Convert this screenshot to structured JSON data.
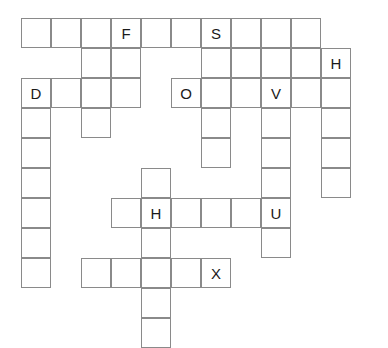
{
  "puzzle": {
    "title": "crossword-grid",
    "grid": {
      "origin_x": 21,
      "origin_y": 18,
      "cell_size": 30,
      "columns": 11,
      "rows": 11,
      "border_color": "#8a8a8a",
      "cell_background": "#ffffff",
      "letter_color": "#1a1a1a",
      "page_background": "#ffffff"
    },
    "cells": [
      {
        "row": 0,
        "col": 0,
        "letter": ""
      },
      {
        "row": 0,
        "col": 1,
        "letter": ""
      },
      {
        "row": 0,
        "col": 2,
        "letter": ""
      },
      {
        "row": 0,
        "col": 3,
        "letter": "F"
      },
      {
        "row": 0,
        "col": 4,
        "letter": ""
      },
      {
        "row": 0,
        "col": 5,
        "letter": ""
      },
      {
        "row": 0,
        "col": 6,
        "letter": "S"
      },
      {
        "row": 0,
        "col": 7,
        "letter": ""
      },
      {
        "row": 0,
        "col": 8,
        "letter": ""
      },
      {
        "row": 0,
        "col": 9,
        "letter": ""
      },
      {
        "row": 1,
        "col": 2,
        "letter": ""
      },
      {
        "row": 1,
        "col": 3,
        "letter": ""
      },
      {
        "row": 1,
        "col": 6,
        "letter": ""
      },
      {
        "row": 1,
        "col": 7,
        "letter": ""
      },
      {
        "row": 1,
        "col": 8,
        "letter": ""
      },
      {
        "row": 1,
        "col": 9,
        "letter": ""
      },
      {
        "row": 1,
        "col": 10,
        "letter": "H"
      },
      {
        "row": 2,
        "col": 0,
        "letter": "D"
      },
      {
        "row": 2,
        "col": 1,
        "letter": ""
      },
      {
        "row": 2,
        "col": 2,
        "letter": ""
      },
      {
        "row": 2,
        "col": 3,
        "letter": ""
      },
      {
        "row": 2,
        "col": 5,
        "letter": "O"
      },
      {
        "row": 2,
        "col": 6,
        "letter": ""
      },
      {
        "row": 2,
        "col": 7,
        "letter": ""
      },
      {
        "row": 2,
        "col": 8,
        "letter": "V"
      },
      {
        "row": 2,
        "col": 9,
        "letter": ""
      },
      {
        "row": 2,
        "col": 10,
        "letter": ""
      },
      {
        "row": 3,
        "col": 0,
        "letter": ""
      },
      {
        "row": 3,
        "col": 2,
        "letter": ""
      },
      {
        "row": 3,
        "col": 6,
        "letter": ""
      },
      {
        "row": 3,
        "col": 8,
        "letter": ""
      },
      {
        "row": 3,
        "col": 10,
        "letter": ""
      },
      {
        "row": 4,
        "col": 0,
        "letter": ""
      },
      {
        "row": 4,
        "col": 6,
        "letter": ""
      },
      {
        "row": 4,
        "col": 8,
        "letter": ""
      },
      {
        "row": 4,
        "col": 10,
        "letter": ""
      },
      {
        "row": 5,
        "col": 0,
        "letter": ""
      },
      {
        "row": 5,
        "col": 4,
        "letter": ""
      },
      {
        "row": 5,
        "col": 8,
        "letter": ""
      },
      {
        "row": 5,
        "col": 10,
        "letter": ""
      },
      {
        "row": 6,
        "col": 0,
        "letter": ""
      },
      {
        "row": 6,
        "col": 3,
        "letter": ""
      },
      {
        "row": 6,
        "col": 4,
        "letter": "H"
      },
      {
        "row": 6,
        "col": 5,
        "letter": ""
      },
      {
        "row": 6,
        "col": 6,
        "letter": ""
      },
      {
        "row": 6,
        "col": 7,
        "letter": ""
      },
      {
        "row": 6,
        "col": 8,
        "letter": "U"
      },
      {
        "row": 7,
        "col": 0,
        "letter": ""
      },
      {
        "row": 7,
        "col": 4,
        "letter": ""
      },
      {
        "row": 7,
        "col": 8,
        "letter": ""
      },
      {
        "row": 8,
        "col": 0,
        "letter": ""
      },
      {
        "row": 8,
        "col": 2,
        "letter": ""
      },
      {
        "row": 8,
        "col": 3,
        "letter": ""
      },
      {
        "row": 8,
        "col": 4,
        "letter": ""
      },
      {
        "row": 8,
        "col": 5,
        "letter": ""
      },
      {
        "row": 8,
        "col": 6,
        "letter": "X"
      },
      {
        "row": 9,
        "col": 4,
        "letter": ""
      },
      {
        "row": 10,
        "col": 4,
        "letter": ""
      }
    ]
  }
}
